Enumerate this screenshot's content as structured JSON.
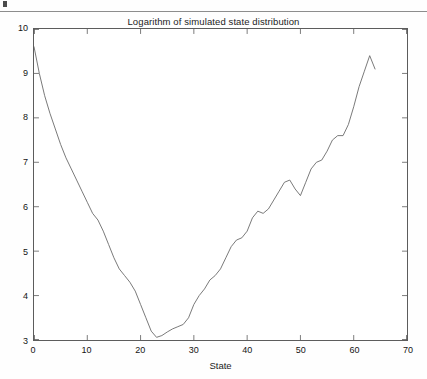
{
  "figure": {
    "title": "Logarithm of simulated state distribution",
    "xlabel": "State",
    "ylabel": ""
  },
  "colors": {
    "line": "#6b6b6b",
    "frame": "#5c5c5c",
    "text": "#141414",
    "background": "#ffffff",
    "rule": "#8d8d8d"
  },
  "chart_data": {
    "type": "line",
    "title": "Logarithm of simulated state distribution",
    "xlabel": "State",
    "ylabel": "",
    "xlim": [
      0,
      70
    ],
    "ylim": [
      3,
      10
    ],
    "xticks": [
      0,
      10,
      20,
      30,
      40,
      50,
      60,
      70
    ],
    "yticks": [
      3,
      4,
      5,
      6,
      7,
      8,
      9,
      10
    ],
    "grid": false,
    "legend": false,
    "series": [
      {
        "name": "log state distribution",
        "x": [
          0,
          1,
          2,
          3,
          4,
          5,
          6,
          7,
          8,
          9,
          10,
          11,
          12,
          13,
          14,
          15,
          16,
          17,
          18,
          19,
          20,
          21,
          22,
          23,
          24,
          25,
          26,
          27,
          28,
          29,
          30,
          31,
          32,
          33,
          34,
          35,
          36,
          37,
          38,
          39,
          40,
          41,
          42,
          43,
          44,
          45,
          46,
          47,
          48,
          49,
          50,
          51,
          52,
          53,
          54,
          55,
          56,
          57,
          58,
          59,
          60,
          61,
          62,
          63,
          64
        ],
        "values": [
          9.6,
          9.0,
          8.5,
          8.1,
          7.75,
          7.4,
          7.1,
          6.85,
          6.6,
          6.35,
          6.1,
          5.85,
          5.7,
          5.45,
          5.15,
          4.85,
          4.6,
          4.45,
          4.3,
          4.1,
          3.8,
          3.5,
          3.2,
          3.06,
          3.1,
          3.18,
          3.25,
          3.3,
          3.35,
          3.5,
          3.8,
          4.0,
          4.15,
          4.35,
          4.45,
          4.6,
          4.85,
          5.1,
          5.25,
          5.3,
          5.45,
          5.75,
          5.9,
          5.85,
          5.95,
          6.15,
          6.35,
          6.55,
          6.6,
          6.4,
          6.25,
          6.55,
          6.85,
          7.0,
          7.05,
          7.25,
          7.5,
          7.6,
          7.6,
          7.85,
          8.25,
          8.7,
          9.05,
          9.4,
          9.1
        ]
      }
    ]
  },
  "axis_ticks": {
    "x": [
      "0",
      "10",
      "20",
      "30",
      "40",
      "50",
      "60",
      "70"
    ],
    "y": [
      "10",
      "9",
      "8",
      "7",
      "6",
      "5",
      "4",
      "3"
    ]
  }
}
